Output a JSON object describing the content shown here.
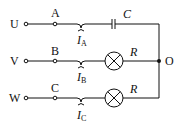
{
  "diagram": {
    "type": "three-phase circuit",
    "phases": [
      {
        "source": "U",
        "terminal": "A",
        "current": "I",
        "current_sub": "A",
        "load": "capacitor",
        "load_label": "C"
      },
      {
        "source": "V",
        "terminal": "B",
        "current": "I",
        "current_sub": "B",
        "load": "lamp",
        "load_label": "R"
      },
      {
        "source": "W",
        "terminal": "C",
        "current": "I",
        "current_sub": "C",
        "load": "lamp",
        "load_label": "R"
      }
    ],
    "neutral_node": "O",
    "colors": {
      "line": "#111111",
      "background": "#ffffff"
    }
  }
}
